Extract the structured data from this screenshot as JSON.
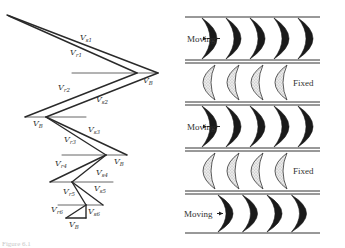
{
  "figure": {
    "caption": "Figure 6.1",
    "velocity_diagram": {
      "title": "Velocity triangles",
      "labels": [
        {
          "id": "vs1",
          "base": "V",
          "sub": "s1"
        },
        {
          "id": "vr1",
          "base": "V",
          "sub": "r1"
        },
        {
          "id": "vb1",
          "base": "V",
          "sub": "B"
        },
        {
          "id": "vr2",
          "base": "V",
          "sub": "r2"
        },
        {
          "id": "vs2",
          "base": "V",
          "sub": "s2"
        },
        {
          "id": "vb2",
          "base": "V",
          "sub": "B"
        },
        {
          "id": "vs3",
          "base": "V",
          "sub": "s3"
        },
        {
          "id": "vr3",
          "base": "V",
          "sub": "r3"
        },
        {
          "id": "vb3",
          "base": "V",
          "sub": "B"
        },
        {
          "id": "vr4",
          "base": "V",
          "sub": "r4"
        },
        {
          "id": "vs4",
          "base": "V",
          "sub": "s4"
        },
        {
          "id": "vr5",
          "base": "V",
          "sub": "r5"
        },
        {
          "id": "vs5",
          "base": "V",
          "sub": "s5"
        },
        {
          "id": "vr6",
          "base": "V",
          "sub": "r6"
        },
        {
          "id": "vs6",
          "base": "V",
          "sub": "s6"
        },
        {
          "id": "vb4",
          "base": "V",
          "sub": "B"
        }
      ]
    },
    "blade_rows": [
      {
        "type": "moving",
        "label": "Moving",
        "blade_count": 5
      },
      {
        "type": "fixed",
        "label": "Fixed",
        "blade_count": 4
      },
      {
        "type": "moving",
        "label": "Moving",
        "blade_count": 5
      },
      {
        "type": "fixed",
        "label": "Fixed",
        "blade_count": 4
      },
      {
        "type": "moving",
        "label": "Moving",
        "blade_count": 4
      }
    ],
    "colors": {
      "ink": "#1a1a1a",
      "line": "#333333",
      "fixed_fill": "#d9d9d9"
    }
  }
}
